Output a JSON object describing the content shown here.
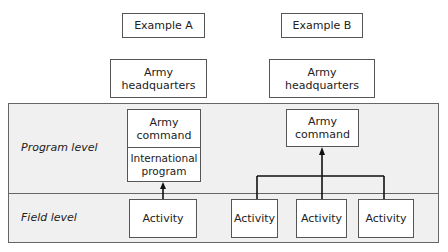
{
  "examples": [
    {
      "title": "Example A",
      "headquarters": "Army headquarters",
      "program_boxes": [
        "Army command",
        "International program"
      ],
      "field_boxes": [
        "Activity"
      ]
    },
    {
      "title": "Example B",
      "headquarters": "Army headquarters",
      "program_boxes": [
        "Army command"
      ],
      "field_boxes": [
        "Activity",
        "Activity",
        "Activity"
      ]
    }
  ],
  "levels": {
    "program": "Program level",
    "field": "Field level"
  },
  "colors": {
    "panel_bg": "#f0f0f0",
    "border": "#555555",
    "line": "#111111"
  }
}
